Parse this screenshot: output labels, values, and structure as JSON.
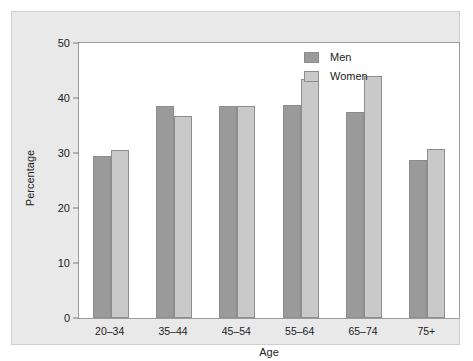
{
  "chart_data": {
    "type": "bar",
    "title": "",
    "xlabel": "Age",
    "ylabel": "Percentage",
    "categories": [
      "20–34",
      "35–44",
      "45–54",
      "55–64",
      "65–74",
      "75+"
    ],
    "series": [
      {
        "name": "Men",
        "color": "#9a9a9a",
        "values": [
          29.4,
          38.6,
          38.6,
          38.8,
          37.4,
          28.7
        ]
      },
      {
        "name": "Women",
        "color": "#c9c9c9",
        "values": [
          30.5,
          36.8,
          38.6,
          43.5,
          44.0,
          30.7
        ]
      }
    ],
    "ylim": [
      0,
      50
    ],
    "yticks": [
      0,
      10,
      20,
      30,
      40,
      50
    ],
    "ytick_labels": [
      "0",
      "10",
      "20",
      "30",
      "40",
      "50"
    ],
    "grid": false,
    "legend_position": "top-right"
  },
  "figure": {
    "background": "#e9e9e9",
    "plot_background": "#ffffff",
    "border_color": "#9d9d9d"
  }
}
